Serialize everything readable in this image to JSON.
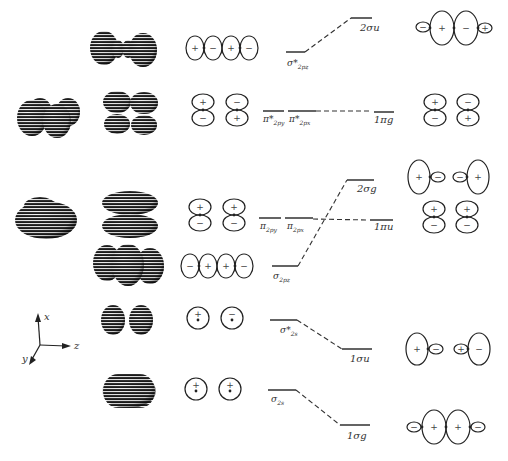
{
  "figure": {
    "title": ""
  },
  "axes": {
    "x_label": "x",
    "y_label": "y",
    "z_label": "z"
  },
  "rows": [
    {
      "id": "sigma-star-2pz",
      "left_label": "σ*",
      "left_sub": "2pz",
      "right_label": "2σu",
      "left_orbital_signs": [
        "+",
        "−",
        "+",
        "−"
      ],
      "right_orbital_signs": [
        "−",
        "+",
        "−",
        "+"
      ],
      "has_left_3d": false,
      "has_3d": true
    },
    {
      "id": "pi-star-2p",
      "left_labels": [
        {
          "main": "π*",
          "sub": "2py"
        },
        {
          "main": "π*",
          "sub": "2px"
        }
      ],
      "right_label": "1πg",
      "left_orbital_signs": [
        [
          "+",
          "−"
        ],
        [
          "−",
          "+"
        ]
      ],
      "right_orbital_signs": [
        [
          "+",
          "−"
        ],
        [
          "−",
          "+"
        ]
      ],
      "has_left_3d": true,
      "has_3d": true
    },
    {
      "id": "two-sigma-g",
      "right_label": "2σg",
      "right_orbital_signs": [
        [
          "+",
          "−"
        ],
        [
          "−",
          "+"
        ]
      ]
    },
    {
      "id": "pi-2p",
      "left_labels": [
        {
          "main": "π",
          "sub": "2py"
        },
        {
          "main": "π",
          "sub": "2px"
        }
      ],
      "right_label": "1πu",
      "left_orbital_signs": [
        [
          "+",
          "−"
        ],
        [
          "+",
          "−"
        ]
      ],
      "right_orbital_signs": [
        [
          "+",
          "−"
        ],
        [
          "+",
          "−"
        ]
      ],
      "has_left_3d": true,
      "has_3d": true
    },
    {
      "id": "sigma-2pz",
      "left_label": "σ",
      "left_sub": "2pz",
      "left_orbital_signs": [
        "−",
        "+",
        "+",
        "−"
      ],
      "has_3d": true
    },
    {
      "id": "sigma-star-2s",
      "left_label": "σ*",
      "left_sub": "2s",
      "right_label": "1σu",
      "left_orbital_signs": [
        "+",
        "−"
      ],
      "right_orbital_signs": [
        [
          "+",
          "−"
        ],
        [
          "+",
          "−"
        ]
      ],
      "has_3d": true
    },
    {
      "id": "sigma-2s",
      "left_label": "σ",
      "left_sub": "2s",
      "right_label": "1σg",
      "left_orbital_signs": [
        "+",
        "+"
      ],
      "right_orbital_signs": [
        "−",
        "+",
        "+",
        "−"
      ],
      "has_3d": true
    }
  ],
  "colors": {
    "ink": "#222222",
    "background": "#ffffff",
    "surface_dark": "#1a1a1a",
    "surface_light": "#e8e8e8"
  }
}
